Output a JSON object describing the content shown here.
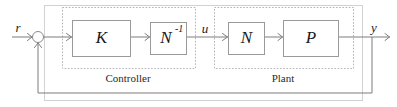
{
  "diagram": {
    "type": "control-block-diagram",
    "colors": {
      "background": "#ffffff",
      "block_border": "#9a9a9a",
      "group_border": "#b4b4b4",
      "frame_border": "#d2d2d2",
      "wire": "#7d7d7d",
      "text": "#1a1a1a"
    },
    "blocks": [
      {
        "id": "K",
        "label": "K",
        "superscript": "",
        "x": 72,
        "y": 20,
        "w": 58,
        "h": 36
      },
      {
        "id": "Ninv",
        "label": "N",
        "superscript": "-1",
        "x": 150,
        "y": 22,
        "w": 36,
        "h": 32
      },
      {
        "id": "N",
        "label": "N",
        "superscript": "",
        "x": 228,
        "y": 22,
        "w": 36,
        "h": 32
      },
      {
        "id": "P",
        "label": "P",
        "superscript": "",
        "x": 283,
        "y": 20,
        "w": 55,
        "h": 36
      }
    ],
    "groups": [
      {
        "id": "controller",
        "label": "Controller",
        "x": 62,
        "y": 7,
        "w": 133,
        "h": 61
      },
      {
        "id": "plant",
        "label": "Plant",
        "x": 214,
        "y": 7,
        "w": 139,
        "h": 61
      }
    ],
    "signals": [
      {
        "id": "r",
        "label": "r",
        "x": 18,
        "y": 32
      },
      {
        "id": "u",
        "label": "u",
        "x": 205,
        "y": 33
      },
      {
        "id": "y",
        "label": "y",
        "x": 374,
        "y": 32
      }
    ],
    "summing_junction": {
      "id": "sum",
      "cx": 38,
      "cy": 37,
      "r": 5.5,
      "inputs": [
        "r",
        "feedback"
      ]
    },
    "feedback": {
      "takeoff_x": 372,
      "bottom_y": 93,
      "return_x": 38
    }
  }
}
